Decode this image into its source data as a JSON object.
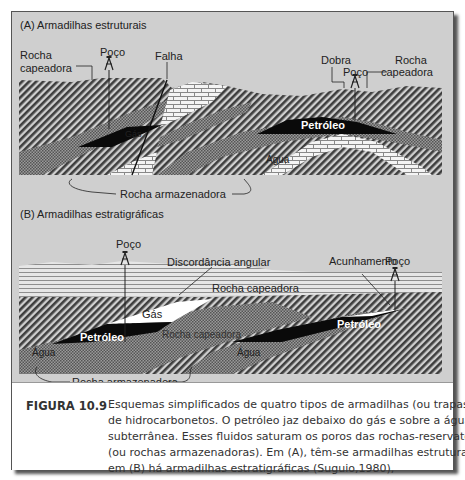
{
  "figure": {
    "panel_a": {
      "title": "(A) Armadilhas estruturais",
      "labels": {
        "rocha_capeadora_left_1": "Rocha",
        "rocha_capeadora_left_2": "capeadora",
        "poco_left": "Poço",
        "falha": "Falha",
        "dobra": "Dobra",
        "poco_right": "Poço",
        "rocha_capeadora_right_1": "Rocha",
        "rocha_capeadora_right_2": "capeadora",
        "gas": "Gás",
        "petroleo": "Petróleo",
        "agua": "Água",
        "rocha_armazenadora": "Rocha armazenadora"
      }
    },
    "panel_b": {
      "title": "(B) Armadilhas estratigráficas",
      "labels": {
        "poco_left": "Poço",
        "discordancia": "Discordância angular",
        "acunhamento": "Acunhamento",
        "poco_right": "Poço",
        "rocha_capeadora_top": "Rocha capeadora",
        "gas": "Gás",
        "petroleo_left": "Petróleo",
        "rocha_capeadora_mid": "Rocha capeadora",
        "petroleo_right": "Petróleo",
        "agua_left": "Água",
        "agua_right": "Água",
        "rocha_armazenadora": "Rocha armazenadora"
      }
    },
    "colors": {
      "background": "#cfcfcf",
      "rock_dark": "#4a4a4a",
      "oil": "#0a0a0a",
      "gas": "#ffffff"
    }
  },
  "caption": {
    "label": "FIGURA 10.9",
    "lines": [
      "Esquemas simplificados de quatro tipos de armadilhas (ou trapas)",
      "de hidrocarbonetos. O petróleo jaz debaixo do gás e sobre a água",
      "subterrânea. Esses fluidos saturam os poros das rochas-reservatório",
      "(ou rochas armazenadoras). Em (A), têm-se armadilhas estruturais e",
      "em (B) há armadilhas estratigráficas (Suguio,1980),"
    ]
  }
}
